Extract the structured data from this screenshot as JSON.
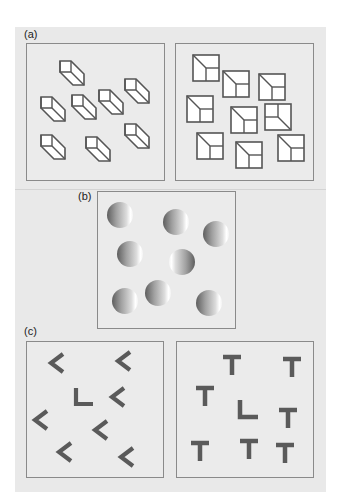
{
  "figure": {
    "panels": [
      {
        "id": "a",
        "label": "(a)",
        "description": "Visual search: cubes vs. squares-with-diagonals"
      },
      {
        "id": "b",
        "label": "(b)",
        "description": "Shaded spheres, one lit from opposite side"
      },
      {
        "id": "c",
        "label": "(c)",
        "description": "L among rotated L's vs. L among T's"
      }
    ],
    "colors": {
      "background": "#e9e9e9",
      "box_border": "#8a8a8a",
      "stroke": "#555555",
      "glyph_fill": "#ffffff",
      "letter_fill": "#5a5a5a"
    },
    "panel_a_left_cubes": [
      {
        "x": 60,
        "y": 61
      },
      {
        "x": 125,
        "y": 79
      },
      {
        "x": 41,
        "y": 97
      },
      {
        "x": 72,
        "y": 95
      },
      {
        "x": 99,
        "y": 90
      },
      {
        "x": 41,
        "y": 135
      },
      {
        "x": 86,
        "y": 137
      },
      {
        "x": 125,
        "y": 124
      }
    ],
    "panel_a_right_squares": [
      {
        "x": 193,
        "y": 55,
        "odd": false
      },
      {
        "x": 223,
        "y": 71,
        "odd": false
      },
      {
        "x": 259,
        "y": 74,
        "odd": false
      },
      {
        "x": 187,
        "y": 96,
        "odd": false
      },
      {
        "x": 231,
        "y": 107,
        "odd": false
      },
      {
        "x": 265,
        "y": 104,
        "odd": true
      },
      {
        "x": 197,
        "y": 133,
        "odd": false
      },
      {
        "x": 236,
        "y": 142,
        "odd": false
      },
      {
        "x": 278,
        "y": 135,
        "odd": false
      }
    ],
    "panel_b_spheres": [
      {
        "cx": 120,
        "cy": 215,
        "odd": false
      },
      {
        "cx": 176,
        "cy": 222,
        "odd": false
      },
      {
        "cx": 216,
        "cy": 234,
        "odd": false
      },
      {
        "cx": 130,
        "cy": 254,
        "odd": false
      },
      {
        "cx": 182,
        "cy": 262,
        "odd": true
      },
      {
        "cx": 125,
        "cy": 301,
        "odd": false
      },
      {
        "cx": 158,
        "cy": 293,
        "odd": false
      },
      {
        "cx": 209,
        "cy": 303,
        "odd": false
      }
    ],
    "panel_c_left_items": [
      {
        "type": "chevron",
        "cx": 57,
        "cy": 363
      },
      {
        "type": "chevron",
        "cx": 124,
        "cy": 361
      },
      {
        "type": "L",
        "cx": 83,
        "cy": 398
      },
      {
        "type": "chevron",
        "cx": 118,
        "cy": 397
      },
      {
        "type": "chevron",
        "cx": 41,
        "cy": 420
      },
      {
        "type": "chevron",
        "cx": 101,
        "cy": 430
      },
      {
        "type": "chevron",
        "cx": 65,
        "cy": 452
      },
      {
        "type": "chevron",
        "cx": 127,
        "cy": 457
      }
    ],
    "panel_c_right_items": [
      {
        "type": "T",
        "cx": 232,
        "cy": 365
      },
      {
        "type": "T",
        "cx": 292,
        "cy": 367
      },
      {
        "type": "T",
        "cx": 205,
        "cy": 396
      },
      {
        "type": "L",
        "cx": 247,
        "cy": 410
      },
      {
        "type": "T",
        "cx": 288,
        "cy": 418
      },
      {
        "type": "T",
        "cx": 200,
        "cy": 451
      },
      {
        "type": "T",
        "cx": 249,
        "cy": 449
      },
      {
        "type": "T",
        "cx": 285,
        "cy": 453
      }
    ]
  }
}
